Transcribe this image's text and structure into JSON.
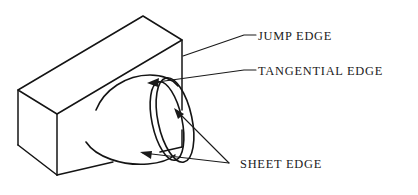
{
  "diagram": {
    "background_color": "#ffffff",
    "line_color": "#141414",
    "text_color": "#1a1a1a",
    "width": 418,
    "height": 195
  },
  "labels": {
    "jump_edge": "JUMP EDGE",
    "tangential_edge": "TANGENTIAL EDGE",
    "sheet_edge": "SHEET EDGE"
  },
  "shapes": {
    "block": {
      "name": "rectangular block",
      "top_face": "18,90 143,16 182,40 57,114",
      "left_vertical_edge": "18,90 18,145",
      "right_vertical_edge": "182,40 182,110",
      "front_vertical_edge": "57,114 57,175",
      "bottom_left_edge": "18,145 57,175",
      "bottom_right_edge": "57,175 182,147"
    },
    "cylinder": {
      "name": "cylindrical boss (tube)",
      "top_silhouette": "98,108 118,82 148,74 175,82",
      "bottom_silhouette": "88,145 118,160 150,164 172,158",
      "outer_ellipse_center": "174,120",
      "outer_ellipse_rx": 17,
      "outer_ellipse_ry": 43,
      "outer_ellipse_rotation": -12,
      "inner_ellipse_center": "167,120",
      "inner_ellipse_rx": 15,
      "inner_ellipse_ry": 40,
      "inner_ellipse_rotation": -12
    }
  },
  "leaders": {
    "jump_edge": {
      "target_point": "182,55",
      "path": "182,55 245,35 256,35",
      "has_arrow": false
    },
    "tangential_edge": {
      "target_point": "148,83",
      "path": "148,83 245,70 256,70",
      "has_arrow": true
    },
    "sheet_edge_upper": {
      "target_point": "175,110",
      "path": "175,110 228,163",
      "has_arrow": true
    },
    "sheet_edge_lower": {
      "target_point": "144,152",
      "path": "144,152 228,163",
      "has_arrow": true
    }
  },
  "text_positions": {
    "jump_edge": {
      "x": 258,
      "y": 40
    },
    "tangential_edge": {
      "x": 258,
      "y": 75
    },
    "sheet_edge": {
      "x": 240,
      "y": 168
    }
  }
}
